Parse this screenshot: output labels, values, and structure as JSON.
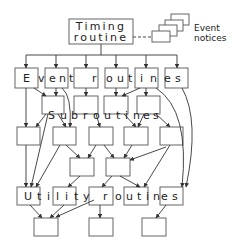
{
  "diagram": {
    "timing": {
      "line1": "Timing",
      "line2": "routine"
    },
    "event_notices": {
      "line1": "Event",
      "line2": "notices"
    },
    "labels": {
      "event_routines": [
        "E",
        "v",
        "e",
        "n",
        "t",
        "r",
        "o",
        "u",
        "t",
        "i",
        "n",
        "e",
        "s"
      ],
      "subroutines": [
        "S",
        "u",
        "b",
        "r",
        "o",
        "u",
        "t",
        "i",
        "n",
        "e",
        "s"
      ],
      "utility_routines": [
        "U",
        "t",
        "i",
        "l",
        "i",
        "t",
        "y",
        "r",
        "o",
        "u",
        "t",
        "i",
        "n",
        "e",
        "s"
      ]
    },
    "colors": {
      "stroke": "#333333",
      "box_stroke": "#555555",
      "background": "#ffffff"
    }
  }
}
